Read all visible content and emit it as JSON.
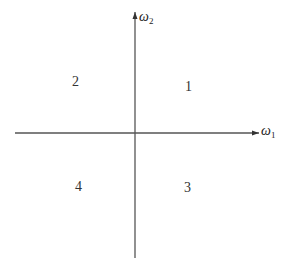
{
  "diagram": {
    "type": "coordinate-plane-quadrants",
    "axes": {
      "horizontal": {
        "symbol": "ω",
        "subscript": "1",
        "direction": "right"
      },
      "vertical": {
        "symbol": "ω",
        "subscript": "2",
        "direction": "up"
      }
    },
    "quadrants": [
      {
        "position": "upper-right",
        "label": "1"
      },
      {
        "position": "upper-left",
        "label": "2"
      },
      {
        "position": "lower-right",
        "label": "3"
      },
      {
        "position": "lower-left",
        "label": "4"
      }
    ],
    "colors": {
      "axis_line": "#555555",
      "text": "#222222",
      "background": "#ffffff"
    }
  }
}
